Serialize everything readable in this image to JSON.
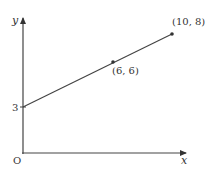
{
  "diagram": {
    "axes": {
      "x_label": "x",
      "y_label": "y",
      "origin_label": "O",
      "y_intercept_tick_label": "3"
    },
    "line": {
      "start": {
        "x": 0,
        "y": 3
      },
      "end": {
        "x": 10,
        "y": 8
      }
    },
    "points": [
      {
        "label": "(6, 6)",
        "x": 6,
        "y": 6
      },
      {
        "label": "(10, 8)",
        "x": 10,
        "y": 8
      }
    ],
    "colors": {
      "axis": "#333333",
      "line": "#333333",
      "point": "#333333"
    }
  }
}
